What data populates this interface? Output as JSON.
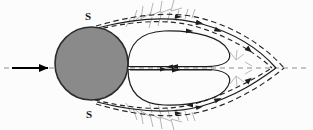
{
  "figure": {
    "background_color": "#fcfcfc",
    "width": 313,
    "height": 130
  },
  "labels": {
    "separation_top": "S",
    "separation_bottom": "S"
  },
  "colors": {
    "body_fill": "#8a8a8a",
    "body_stroke": "#2b2b2b",
    "streamline": "#1e1e1e",
    "dashed_line": "#262626",
    "axis_dashed": "#8d8d8d",
    "hair_marks": "#9a9a9a",
    "inflow_arrow": "#000000"
  },
  "geometry": {
    "body": {
      "shape": "circle",
      "cx": 91.5,
      "cy": 63.5,
      "r": 36.5
    },
    "inflow_arrow": {
      "x1": 12,
      "y1": 68,
      "x2": 52,
      "y2": 68,
      "direction": "right"
    },
    "axis": {
      "y": 68,
      "x1": 4,
      "x2": 310,
      "style": "dashed"
    },
    "wake_cusp_solid_x": 272,
    "wake_cusp_dashed_x": 284,
    "separation_point_top": {
      "x": 97,
      "y": 29
    },
    "separation_point_bottom": {
      "x": 97,
      "y": 101
    }
  },
  "annotations": {
    "separation_marker": "S",
    "flow_direction": "left-to-right",
    "wake_type": "two counter-rotating recirculation vortices",
    "centerline_reverse_flow": true
  }
}
